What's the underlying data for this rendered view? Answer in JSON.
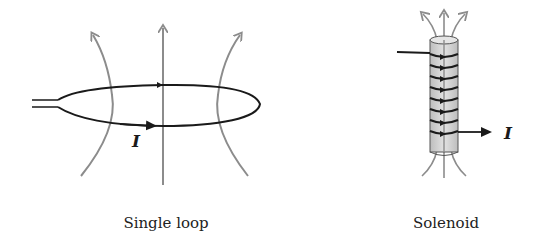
{
  "figure": {
    "panels": [
      {
        "id": "single-loop",
        "caption": "Single loop",
        "current_label": "I"
      },
      {
        "id": "solenoid",
        "caption": "Solenoid",
        "current_label": "I"
      }
    ],
    "colors": {
      "wire": "#1a1a1a",
      "field_line": "#8c8c8c",
      "solenoid_body": "#d0d0d0",
      "background": "#ffffff"
    }
  }
}
